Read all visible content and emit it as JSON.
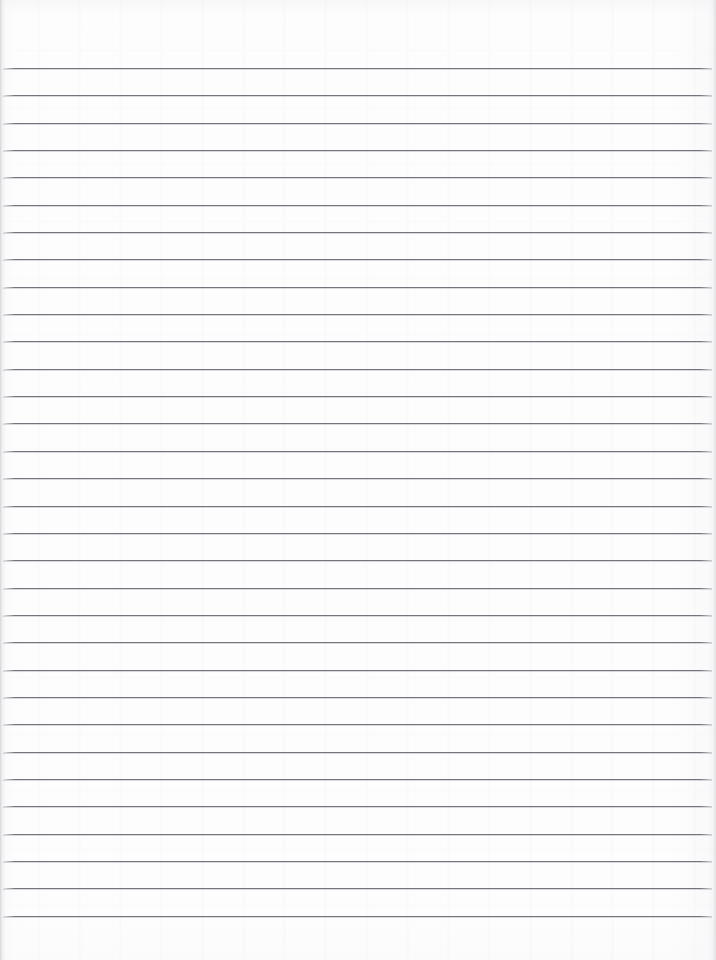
{
  "document": {
    "kind": "scanned-lined-paper",
    "title": "Blank ruled notebook page",
    "page_width": 716,
    "page_height": 960,
    "orientation": "portrait",
    "content_text": "",
    "has_handwriting": false,
    "has_printed_text": false,
    "has_margin_rule": false,
    "has_holes": false
  },
  "colors": {
    "paper_background": "#fdfdfd",
    "rule_line": "#74747c",
    "rule_line_highlight": "#9a9aa2",
    "edge_shadow": "#cdcdd2"
  },
  "layout": {
    "top_margin_px": 66,
    "bottom_margin_px": 32,
    "left_inset_px": 3,
    "right_inset_px": 4,
    "rule_spacing_px": 27.3,
    "rule_thickness_px": 1.5,
    "rule_count": 32,
    "first_rule_y": 68,
    "last_rule_y": 926,
    "rule_start_x": 3,
    "rule_end_x": 712
  },
  "rules": [
    {
      "index": 1,
      "y": 68.0,
      "x1": 3,
      "x2": 712
    },
    {
      "index": 2,
      "y": 95.3,
      "x1": 3,
      "x2": 712
    },
    {
      "index": 3,
      "y": 122.7,
      "x1": 3,
      "x2": 712
    },
    {
      "index": 4,
      "y": 150.0,
      "x1": 3,
      "x2": 712
    },
    {
      "index": 5,
      "y": 177.4,
      "x1": 3,
      "x2": 712
    },
    {
      "index": 6,
      "y": 204.7,
      "x1": 3,
      "x2": 712
    },
    {
      "index": 7,
      "y": 232.0,
      "x1": 3,
      "x2": 712
    },
    {
      "index": 8,
      "y": 259.4,
      "x1": 3,
      "x2": 712
    },
    {
      "index": 9,
      "y": 286.7,
      "x1": 3,
      "x2": 712
    },
    {
      "index": 10,
      "y": 314.1,
      "x1": 3,
      "x2": 712
    },
    {
      "index": 11,
      "y": 341.4,
      "x1": 3,
      "x2": 712
    },
    {
      "index": 12,
      "y": 368.7,
      "x1": 3,
      "x2": 712
    },
    {
      "index": 13,
      "y": 396.1,
      "x1": 3,
      "x2": 712
    },
    {
      "index": 14,
      "y": 423.4,
      "x1": 3,
      "x2": 712
    },
    {
      "index": 15,
      "y": 450.8,
      "x1": 3,
      "x2": 712
    },
    {
      "index": 16,
      "y": 478.1,
      "x1": 3,
      "x2": 712
    },
    {
      "index": 17,
      "y": 505.5,
      "x1": 3,
      "x2": 712
    },
    {
      "index": 18,
      "y": 532.8,
      "x1": 3,
      "x2": 712
    },
    {
      "index": 19,
      "y": 560.1,
      "x1": 3,
      "x2": 712
    },
    {
      "index": 20,
      "y": 587.5,
      "x1": 3,
      "x2": 712
    },
    {
      "index": 21,
      "y": 614.8,
      "x1": 3,
      "x2": 712
    },
    {
      "index": 22,
      "y": 642.2,
      "x1": 3,
      "x2": 712
    },
    {
      "index": 23,
      "y": 669.5,
      "x1": 3,
      "x2": 712
    },
    {
      "index": 24,
      "y": 696.8,
      "x1": 3,
      "x2": 712
    },
    {
      "index": 25,
      "y": 724.2,
      "x1": 3,
      "x2": 712
    },
    {
      "index": 26,
      "y": 751.5,
      "x1": 3,
      "x2": 712
    },
    {
      "index": 27,
      "y": 778.9,
      "x1": 3,
      "x2": 712
    },
    {
      "index": 28,
      "y": 806.2,
      "x1": 3,
      "x2": 712
    },
    {
      "index": 29,
      "y": 833.6,
      "x1": 3,
      "x2": 712
    },
    {
      "index": 30,
      "y": 860.9,
      "x1": 3,
      "x2": 712
    },
    {
      "index": 31,
      "y": 888.2,
      "x1": 3,
      "x2": 712
    },
    {
      "index": 32,
      "y": 915.6,
      "x1": 3,
      "x2": 712
    }
  ]
}
